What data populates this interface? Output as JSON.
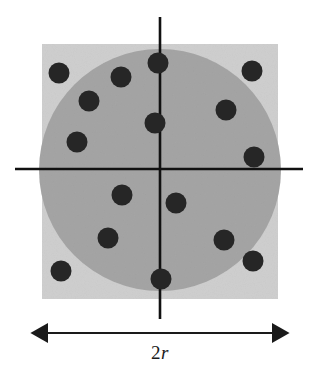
{
  "figure": {
    "caption_label_number": "2",
    "caption_label_symbol": "r",
    "caption_label_full": "2r",
    "background_color": "#ffffff"
  },
  "square": {
    "name": "outer-square",
    "x": 42,
    "y": 44,
    "width": 236,
    "height": 255,
    "fill_color": "#cfcfcf"
  },
  "circle": {
    "name": "inscribed-circle",
    "cx": 160,
    "cy": 170,
    "r": 121,
    "fill_color": "#a5a5a5"
  },
  "axes": {
    "color": "#111111",
    "stroke_width": 2.6,
    "vertical": {
      "x": 160,
      "y1": 17,
      "y2": 319
    },
    "horizontal": {
      "y": 169,
      "x1": 15,
      "x2": 303
    }
  },
  "dimension_arrow": {
    "name": "width-dimension-arrow",
    "y": 333,
    "x1": 42,
    "x2": 278,
    "color": "#1a1a1a",
    "label": "2r"
  },
  "points": {
    "fill_color": "#262626",
    "radius": 10.5,
    "count_total": 16,
    "count_inside_circle": 12,
    "count_outside_circle": 4,
    "list": [
      {
        "id": "p1",
        "x": 59,
        "y": 73,
        "inside_circle": false
      },
      {
        "id": "p2",
        "x": 121,
        "y": 77,
        "inside_circle": true
      },
      {
        "id": "p3",
        "x": 158,
        "y": 63,
        "inside_circle": true
      },
      {
        "id": "p4",
        "x": 252,
        "y": 71,
        "inside_circle": false
      },
      {
        "id": "p5",
        "x": 89,
        "y": 101,
        "inside_circle": true
      },
      {
        "id": "p6",
        "x": 226,
        "y": 110,
        "inside_circle": true
      },
      {
        "id": "p7",
        "x": 155,
        "y": 123,
        "inside_circle": true
      },
      {
        "id": "p8",
        "x": 77,
        "y": 142,
        "inside_circle": true
      },
      {
        "id": "p9",
        "x": 254,
        "y": 157,
        "inside_circle": true
      },
      {
        "id": "p10",
        "x": 122,
        "y": 195,
        "inside_circle": true
      },
      {
        "id": "p11",
        "x": 176,
        "y": 203,
        "inside_circle": true
      },
      {
        "id": "p12",
        "x": 108,
        "y": 238,
        "inside_circle": true
      },
      {
        "id": "p13",
        "x": 224,
        "y": 240,
        "inside_circle": true
      },
      {
        "id": "p14",
        "x": 253,
        "y": 261,
        "inside_circle": false
      },
      {
        "id": "p15",
        "x": 61,
        "y": 271,
        "inside_circle": false
      },
      {
        "id": "p16",
        "x": 161,
        "y": 279,
        "inside_circle": true
      }
    ]
  }
}
